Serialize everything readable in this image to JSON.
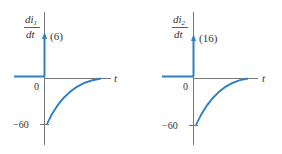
{
  "colors": {
    "curve": "#2f7fc1",
    "axis": "#777777",
    "text": "#333333",
    "background": "#ffffff"
  },
  "panels": [
    {
      "id": "di1",
      "ylabel_num": "di",
      "ylabel_sub": "1",
      "ylabel_den": "dt",
      "impulse_label": "(6)",
      "zero_label": "0",
      "neg_label": "−60",
      "xlabel": "t"
    },
    {
      "id": "di2",
      "ylabel_num": "di",
      "ylabel_sub": "2",
      "ylabel_den": "dt",
      "impulse_label": "(16)",
      "zero_label": "0",
      "neg_label": "−60",
      "xlabel": "t"
    }
  ]
}
